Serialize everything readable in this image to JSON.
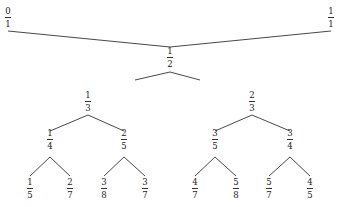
{
  "diagram": {
    "type": "stern-brocot-tree",
    "line_color": "#333333",
    "nodes": [
      {
        "id": "n0_1",
        "num": "0",
        "den": "1",
        "x": 8,
        "y": 7
      },
      {
        "id": "n1_1",
        "num": "1",
        "den": "1",
        "x": 331,
        "y": 7
      },
      {
        "id": "n1_2",
        "num": "1",
        "den": "2",
        "x": 170,
        "y": 47
      },
      {
        "id": "n1_3",
        "num": "1",
        "den": "3",
        "x": 88,
        "y": 91
      },
      {
        "id": "n2_3",
        "num": "2",
        "den": "3",
        "x": 252,
        "y": 91
      },
      {
        "id": "n1_4",
        "num": "1",
        "den": "4",
        "x": 50,
        "y": 129
      },
      {
        "id": "n2_5",
        "num": "2",
        "den": "5",
        "x": 124,
        "y": 129
      },
      {
        "id": "n3_5",
        "num": "3",
        "den": "5",
        "x": 215,
        "y": 129
      },
      {
        "id": "n3_4",
        "num": "3",
        "den": "4",
        "x": 290,
        "y": 129
      },
      {
        "id": "n1_5",
        "num": "1",
        "den": "5",
        "x": 30,
        "y": 178
      },
      {
        "id": "n2_7",
        "num": "2",
        "den": "7",
        "x": 70,
        "y": 178
      },
      {
        "id": "n3_8",
        "num": "3",
        "den": "8",
        "x": 104,
        "y": 178
      },
      {
        "id": "n3_7",
        "num": "3",
        "den": "7",
        "x": 145,
        "y": 178
      },
      {
        "id": "n4_7",
        "num": "4",
        "den": "7",
        "x": 195,
        "y": 178
      },
      {
        "id": "n5_8",
        "num": "5",
        "den": "8",
        "x": 236,
        "y": 178
      },
      {
        "id": "n5_7",
        "num": "5",
        "den": "7",
        "x": 269,
        "y": 178
      },
      {
        "id": "n4_5",
        "num": "4",
        "den": "5",
        "x": 310,
        "y": 178
      }
    ],
    "edges": [
      {
        "from": "n0_1",
        "to": "n1_2",
        "x1": 8,
        "y1": 31,
        "x2": 170,
        "y2": 47
      },
      {
        "from": "n1_1",
        "to": "n1_2",
        "x1": 331,
        "y1": 31,
        "x2": 170,
        "y2": 47
      },
      {
        "from": "n1_2",
        "to": "n1_3",
        "x1": 170,
        "y1": 72,
        "x2": 135,
        "y2": 80
      },
      {
        "from": "n1_2",
        "to": "n2_3",
        "x1": 170,
        "y1": 72,
        "x2": 200,
        "y2": 80
      },
      {
        "from": "n1_3",
        "to": "n1_4",
        "x1": 88,
        "y1": 115,
        "x2": 50,
        "y2": 131
      },
      {
        "from": "n1_3",
        "to": "n2_5",
        "x1": 88,
        "y1": 115,
        "x2": 124,
        "y2": 131
      },
      {
        "from": "n2_3",
        "to": "n3_5",
        "x1": 252,
        "y1": 115,
        "x2": 215,
        "y2": 131
      },
      {
        "from": "n2_3",
        "to": "n3_4",
        "x1": 252,
        "y1": 115,
        "x2": 290,
        "y2": 131
      },
      {
        "from": "n1_4",
        "to": "n1_5",
        "x1": 50,
        "y1": 157,
        "x2": 30,
        "y2": 176
      },
      {
        "from": "n1_4",
        "to": "n2_7",
        "x1": 50,
        "y1": 157,
        "x2": 70,
        "y2": 176
      },
      {
        "from": "n2_5",
        "to": "n3_8",
        "x1": 124,
        "y1": 157,
        "x2": 104,
        "y2": 176
      },
      {
        "from": "n2_5",
        "to": "n3_7",
        "x1": 124,
        "y1": 157,
        "x2": 145,
        "y2": 176
      },
      {
        "from": "n3_5",
        "to": "n4_7",
        "x1": 215,
        "y1": 157,
        "x2": 195,
        "y2": 176
      },
      {
        "from": "n3_5",
        "to": "n5_8",
        "x1": 215,
        "y1": 157,
        "x2": 236,
        "y2": 176
      },
      {
        "from": "n3_4",
        "to": "n5_7",
        "x1": 290,
        "y1": 157,
        "x2": 269,
        "y2": 176
      },
      {
        "from": "n3_4",
        "to": "n4_5",
        "x1": 290,
        "y1": 157,
        "x2": 310,
        "y2": 176
      }
    ]
  }
}
